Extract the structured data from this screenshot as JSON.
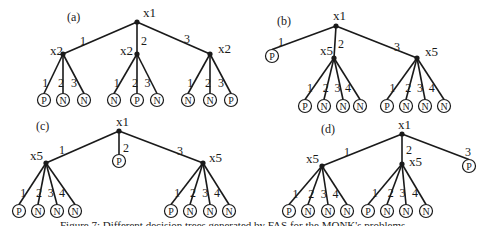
{
  "caption": "Figure 7: Different decision trees generated by FAS for the MONK's problems",
  "colors": {
    "line": "#1a1a1a",
    "background": "#ffffff"
  },
  "panels": [
    {
      "label": "(a)",
      "label_pos": [
        67,
        21
      ],
      "root": {
        "name": "x1",
        "x": 137,
        "y": 22,
        "lx": 143,
        "ly": 17
      },
      "children": [
        {
          "edge": "1",
          "elx": 80,
          "ely": 45,
          "node": {
            "type": "split",
            "name": "x2",
            "x": 63,
            "y": 54,
            "lx": 50,
            "ly": 55
          },
          "leaves": [
            {
              "edge": "1",
              "x": 44,
              "y": 100,
              "cls": "P"
            },
            {
              "edge": "2",
              "x": 63,
              "y": 100,
              "cls": "N"
            },
            {
              "edge": "3",
              "x": 84,
              "y": 100,
              "cls": "N"
            }
          ]
        },
        {
          "edge": "2",
          "elx": 141,
          "ely": 45,
          "node": {
            "type": "split",
            "name": "x2",
            "x": 137,
            "y": 54,
            "lx": 120,
            "ly": 55
          },
          "leaves": [
            {
              "edge": "1",
              "x": 114,
              "y": 100,
              "cls": "N"
            },
            {
              "edge": "2",
              "x": 137,
              "y": 100,
              "cls": "P"
            },
            {
              "edge": "3",
              "x": 157,
              "y": 100,
              "cls": "N"
            }
          ]
        },
        {
          "edge": "3",
          "elx": 184,
          "ely": 43,
          "node": {
            "type": "split",
            "name": "x2",
            "x": 210,
            "y": 54,
            "lx": 218,
            "ly": 53
          },
          "leaves": [
            {
              "edge": "1",
              "x": 188,
              "y": 100,
              "cls": "N"
            },
            {
              "edge": "2",
              "x": 210,
              "y": 100,
              "cls": "N"
            },
            {
              "edge": "3",
              "x": 231,
              "y": 100,
              "cls": "P"
            }
          ]
        }
      ]
    },
    {
      "label": "(b)",
      "label_pos": [
        277,
        25
      ],
      "root": {
        "name": "x1",
        "x": 336,
        "y": 26,
        "lx": 333,
        "ly": 20
      },
      "children": [
        {
          "edge": "1",
          "elx": 278,
          "ely": 46,
          "node": {
            "type": "leaf",
            "cls": "P",
            "x": 272,
            "y": 56
          }
        },
        {
          "edge": "2",
          "elx": 338,
          "ely": 48,
          "node": {
            "type": "split",
            "name": "x5",
            "x": 334,
            "y": 58,
            "lx": 320,
            "ly": 55
          },
          "leaves": [
            {
              "edge": "1",
              "x": 305,
              "y": 106,
              "cls": "P"
            },
            {
              "edge": "2",
              "x": 324,
              "y": 106,
              "cls": "N"
            },
            {
              "edge": "3",
              "x": 343,
              "y": 106,
              "cls": "N"
            },
            {
              "edge": "4",
              "x": 360,
              "y": 106,
              "cls": "N"
            }
          ]
        },
        {
          "edge": "3",
          "elx": 394,
          "ely": 51,
          "node": {
            "type": "split",
            "name": "x5",
            "x": 417,
            "y": 58,
            "lx": 425,
            "ly": 56
          },
          "leaves": [
            {
              "edge": "1",
              "x": 387,
              "y": 106,
              "cls": "P"
            },
            {
              "edge": "2",
              "x": 406,
              "y": 106,
              "cls": "N"
            },
            {
              "edge": "3",
              "x": 425,
              "y": 106,
              "cls": "N"
            },
            {
              "edge": "4",
              "x": 444,
              "y": 106,
              "cls": "N"
            }
          ]
        }
      ]
    },
    {
      "label": "(c)",
      "label_pos": [
        36,
        130
      ],
      "root": {
        "name": "x1",
        "x": 119,
        "y": 131,
        "lx": 116,
        "ly": 126
      },
      "children": [
        {
          "edge": "1",
          "elx": 59,
          "ely": 154,
          "node": {
            "type": "split",
            "name": "x5",
            "x": 46,
            "y": 163,
            "lx": 30,
            "ly": 160
          },
          "leaves": [
            {
              "edge": "1",
              "x": 19,
              "y": 211,
              "cls": "P"
            },
            {
              "edge": "2",
              "x": 38,
              "y": 211,
              "cls": "N"
            },
            {
              "edge": "3",
              "x": 57,
              "y": 211,
              "cls": "N"
            },
            {
              "edge": "4",
              "x": 75,
              "y": 211,
              "cls": "N"
            }
          ]
        },
        {
          "edge": "2",
          "elx": 123,
          "ely": 152,
          "node": {
            "type": "leaf",
            "cls": "P",
            "x": 119,
            "y": 161
          }
        },
        {
          "edge": "3",
          "elx": 177,
          "ely": 155,
          "node": {
            "type": "split",
            "name": "x5",
            "x": 203,
            "y": 163,
            "lx": 209,
            "ly": 162
          },
          "leaves": [
            {
              "edge": "1",
              "x": 171,
              "y": 211,
              "cls": "P"
            },
            {
              "edge": "2",
              "x": 190,
              "y": 211,
              "cls": "N"
            },
            {
              "edge": "3",
              "x": 210,
              "y": 211,
              "cls": "N"
            },
            {
              "edge": "4",
              "x": 229,
              "y": 211,
              "cls": "N"
            }
          ]
        }
      ]
    },
    {
      "label": "(d)",
      "label_pos": [
        321,
        133
      ],
      "root": {
        "name": "x1",
        "x": 402,
        "y": 134,
        "lx": 398,
        "ly": 129
      },
      "children": [
        {
          "edge": "1",
          "elx": 344,
          "ely": 156,
          "node": {
            "type": "split",
            "name": "x5",
            "x": 322,
            "y": 166,
            "lx": 306,
            "ly": 163
          },
          "leaves": [
            {
              "edge": "1",
              "x": 289,
              "y": 211,
              "cls": "P"
            },
            {
              "edge": "2",
              "x": 308,
              "y": 211,
              "cls": "N"
            },
            {
              "edge": "3",
              "x": 328,
              "y": 211,
              "cls": "N"
            },
            {
              "edge": "4",
              "x": 347,
              "y": 211,
              "cls": "N"
            }
          ]
        },
        {
          "edge": "2",
          "elx": 406,
          "ely": 154,
          "node": {
            "type": "split",
            "name": "x5",
            "x": 402,
            "y": 164,
            "lx": 409,
            "ly": 166
          },
          "leaves": [
            {
              "edge": "1",
              "x": 368,
              "y": 211,
              "cls": "P"
            },
            {
              "edge": "2",
              "x": 387,
              "y": 211,
              "cls": "N"
            },
            {
              "edge": "3",
              "x": 406,
              "y": 211,
              "cls": "N"
            },
            {
              "edge": "4",
              "x": 426,
              "y": 211,
              "cls": "N"
            }
          ]
        },
        {
          "edge": "3",
          "elx": 465,
          "ely": 156,
          "node": {
            "type": "leaf",
            "cls": "P",
            "x": 469,
            "y": 166
          }
        }
      ]
    }
  ]
}
